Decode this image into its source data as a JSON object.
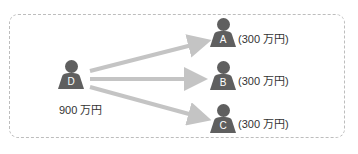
{
  "diagram": {
    "source": {
      "letter": "D",
      "amount_label": "900 万円"
    },
    "targets": [
      {
        "letter": "A",
        "amount_label": "(300 万円)"
      },
      {
        "letter": "B",
        "amount_label": "(300 万円)"
      },
      {
        "letter": "C",
        "amount_label": "(300 万円)"
      }
    ],
    "colors": {
      "person": "#5f5f5f",
      "arrow": "#c4c4c4",
      "border": "#bdbdbd",
      "text": "#333333"
    }
  }
}
